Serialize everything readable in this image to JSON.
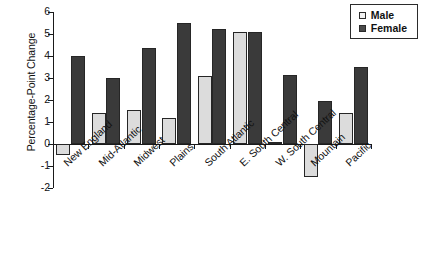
{
  "chart_data": {
    "type": "bar",
    "title": "",
    "xlabel": "",
    "ylabel": "Percentage-Point Change",
    "ylim": [
      -2,
      6
    ],
    "ytick_step": 1,
    "yticks": [
      "6",
      "5",
      "4",
      "3",
      "2",
      "1",
      "0",
      "-1",
      "-2"
    ],
    "grid": false,
    "legend_position": "top-right",
    "categories": [
      "New England",
      "Mid-Atlantic",
      "Midwest",
      "Plains",
      "South Atlantic",
      "E. South Central",
      "W. South Central",
      "Mountain",
      "Pacific"
    ],
    "series": [
      {
        "name": "Male",
        "color": "#dcdcdc",
        "values": [
          -0.5,
          1.4,
          1.55,
          1.2,
          3.1,
          5.1,
          0.1,
          -1.5,
          1.4
        ]
      },
      {
        "name": "Female",
        "color": "#3a3a3a",
        "values": [
          4.0,
          3.0,
          4.35,
          5.5,
          5.25,
          5.1,
          3.15,
          1.95,
          3.5
        ]
      }
    ]
  },
  "legend": {
    "entries": [
      {
        "label": "Male",
        "swatch": "male"
      },
      {
        "label": "Female",
        "swatch": "female"
      }
    ]
  }
}
